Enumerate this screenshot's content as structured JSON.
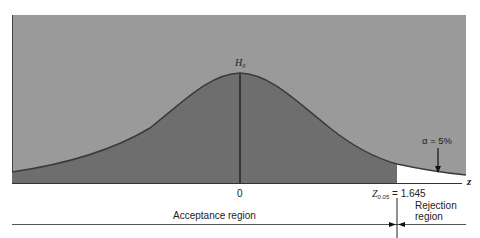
{
  "diagram": {
    "type": "normal-distribution-hypothesis-test",
    "hypothesis_label": "H",
    "hypothesis_sub": "0",
    "center_tick": "0",
    "axis_label": "z",
    "critical_value_label": "Z",
    "critical_value_sub": "0.05",
    "critical_value_text": "= 1.645",
    "alpha_label": "α = 5%",
    "acceptance_label": "Acceptance region",
    "rejection_label_line1": "Rejection",
    "rejection_label_line2": "region",
    "colors": {
      "background_panel": "#9a9a9a",
      "curve_fill": "#6e6e6e",
      "rejection_fill": "#ffffff",
      "curve_line": "#3a3a3a",
      "text": "#222222"
    }
  }
}
